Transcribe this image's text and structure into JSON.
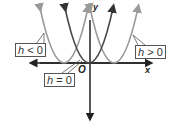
{
  "diagram": {
    "axes": {
      "x_label": "x",
      "y_label": "y",
      "origin_label": "O"
    },
    "curves": [
      {
        "name": "h<0",
        "label_var": "h",
        "label_rel": "< 0",
        "color": "#9a9a9a",
        "vertex_px": [
          64,
          62
        ]
      },
      {
        "name": "h=0",
        "label_var": "h",
        "label_rel": "= 0",
        "color": "#4a4a4a",
        "vertex_px": [
          89,
          62
        ]
      },
      {
        "name": "h>0",
        "label_var": "h",
        "label_rel": "> 0",
        "color": "#9a9a9a",
        "vertex_px": [
          114,
          62
        ]
      }
    ],
    "labels": {
      "h_lt_0": {
        "var": "h",
        "rel": " < 0"
      },
      "h_eq_0": {
        "var": "h",
        "rel": " = 0"
      },
      "h_gt_0": {
        "var": "h",
        "rel": " > 0"
      }
    }
  }
}
